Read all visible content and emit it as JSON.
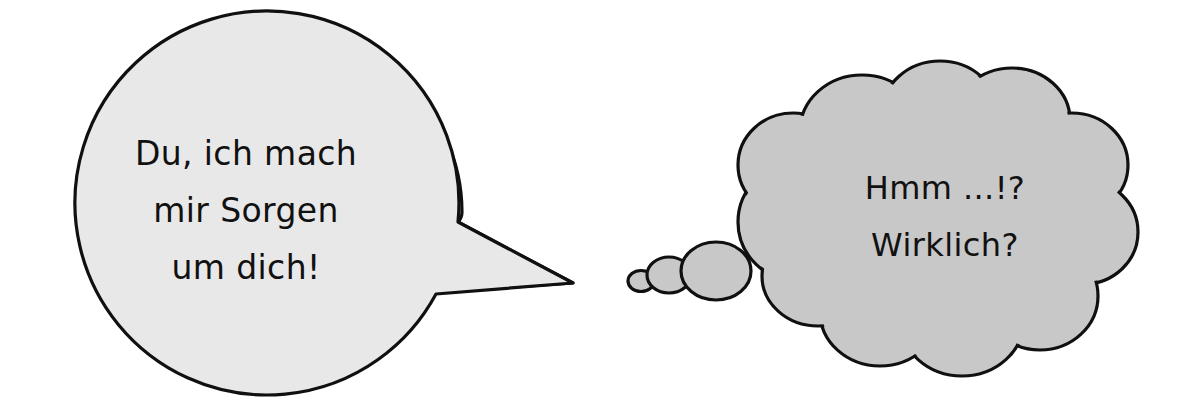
{
  "canvas": {
    "width": 1198,
    "height": 419,
    "background_color": "#ffffff"
  },
  "palette": {
    "outline_color": "#101010",
    "speech_fill": "#e8e8e8",
    "thought_fill": "#c8c8c8",
    "text_color": "#111111"
  },
  "speech_bubble": {
    "shape": "round-speech-balloon-with-tail",
    "fill_color": "#e8e8e8",
    "tail_direction": "right",
    "lines": [
      "Du, ich mach",
      "mir Sorgen",
      "um dich!"
    ],
    "full_text": "Du, ich mach mir Sorgen um dich!"
  },
  "thought_bubble": {
    "shape": "cloud-thought-balloon-with-trailing-puffs",
    "fill_color": "#c8c8c8",
    "trail_direction": "left",
    "trail_puff_count": 3,
    "lines": [
      "Hmm ...!?",
      "Wirklich?"
    ],
    "full_text": "Hmm ...!? Wirklich?"
  }
}
